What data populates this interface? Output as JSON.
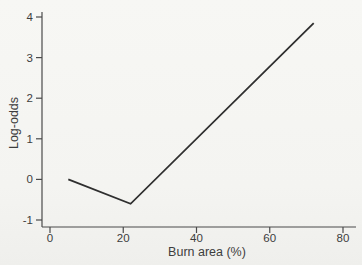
{
  "figure": {
    "background": "#f5f4f1",
    "axis_color": "#4a4a4a",
    "text_color": "#3d3d3d"
  },
  "chart_data": {
    "type": "line",
    "title": "",
    "xlabel": "Burn area (%)",
    "ylabel": "Log-odds",
    "xlim": [
      0,
      80
    ],
    "ylim": [
      -1,
      4
    ],
    "x_ticks": [
      0,
      20,
      40,
      60,
      80
    ],
    "y_ticks": [
      -1,
      0,
      1,
      2,
      3,
      4
    ],
    "grid": false,
    "legend": "none",
    "line_color": "#2f2f2f",
    "series": [
      {
        "name": "log-odds-vs-burn-area",
        "x": [
          5,
          22,
          72
        ],
        "y": [
          0,
          -0.6,
          3.85
        ]
      }
    ]
  }
}
